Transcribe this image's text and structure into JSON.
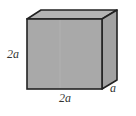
{
  "diagram": {
    "type": "rectangular-box",
    "colors": {
      "front_face": "#a9a9a9",
      "top_face": "#b4b4b4",
      "side_face": "#a2a2a2",
      "edge": "#222222",
      "label": "#333333",
      "background": "#ffffff"
    },
    "labels": {
      "height": "2a",
      "width": "2a",
      "depth": "a"
    }
  }
}
